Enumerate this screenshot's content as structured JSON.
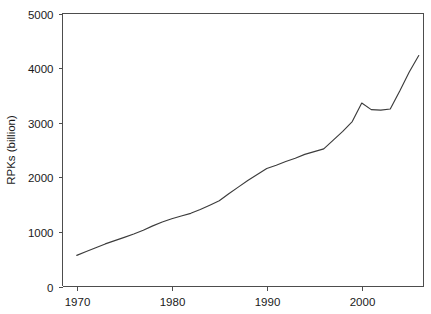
{
  "chart_data": {
    "type": "line",
    "title": "",
    "subtitle": "",
    "xlabel": "",
    "ylabel": "RPKs (billion)",
    "xlim": [
      1968.5,
      2006.5
    ],
    "ylim": [
      0,
      5000
    ],
    "grid": false,
    "legend": null,
    "legend_position": "none",
    "x_ticks": [
      1970,
      1980,
      1990,
      2000
    ],
    "x_tick_labels": [
      "1970",
      "1980",
      "1990",
      "2000"
    ],
    "y_ticks": [
      0,
      1000,
      2000,
      3000,
      4000,
      5000
    ],
    "y_tick_labels": [
      "0",
      "1000",
      "2000",
      "3000",
      "4000",
      "5000"
    ],
    "line_color": "#3c3c3c",
    "axis_color": "#4d4d4d",
    "background_color": "#ffffff",
    "series": [
      {
        "name": "RPKs",
        "x": [
          1970,
          1971,
          1972,
          1973,
          1974,
          1975,
          1976,
          1977,
          1978,
          1979,
          1980,
          1981,
          1982,
          1983,
          1984,
          1985,
          1986,
          1987,
          1988,
          1989,
          1990,
          1991,
          1992,
          1993,
          1994,
          1995,
          1996,
          1997,
          1998,
          1999,
          2000,
          2001,
          2002,
          2003,
          2004,
          2005,
          2006
        ],
        "values": [
          570,
          640,
          710,
          780,
          840,
          900,
          960,
          1030,
          1110,
          1180,
          1240,
          1290,
          1340,
          1410,
          1490,
          1570,
          1700,
          1820,
          1940,
          2050,
          2160,
          2220,
          2290,
          2350,
          2420,
          2470,
          2520,
          2680,
          2840,
          3020,
          3360,
          3240,
          3230,
          3250,
          3580,
          3930,
          4230
        ]
      }
    ],
    "annotations": []
  },
  "axis_labels": {
    "y_axis_title": "RPKs (billion)"
  }
}
